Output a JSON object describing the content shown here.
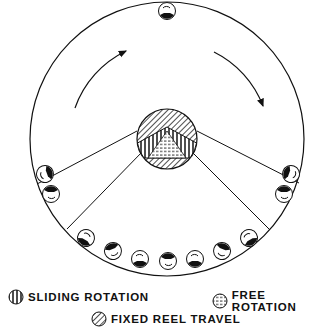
{
  "figure": {
    "type": "drum-with-rolling-balls",
    "outer_circle": {
      "cx": 167,
      "cy": 139,
      "r": 137
    },
    "hub": {
      "cx": 167,
      "cy": 139,
      "r": 30
    },
    "rotation_direction": "clockwise",
    "ball_count": 12
  },
  "legend": {
    "sliding": {
      "label": "SLIDING ROTATION",
      "pattern": "vertical-stripes"
    },
    "free": {
      "label": "FREE ROTATION",
      "pattern": "horizontal-dashes"
    },
    "fixed": {
      "label": "FIXED REEL TRAVEL",
      "pattern": "diagonal-stripes"
    }
  }
}
